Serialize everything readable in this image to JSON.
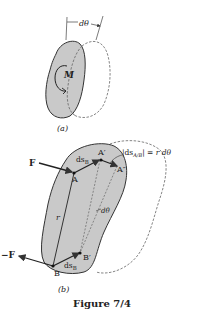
{
  "figure": {
    "caption": "Figure 7/4",
    "colors": {
      "body_fill": "#c9c9c9",
      "outline": "#333333",
      "dashed": "#666666",
      "background": "#ffffff"
    },
    "panel_a": {
      "label": "(a)",
      "angle_label": "dθ",
      "moment_label": "M"
    },
    "panel_b": {
      "label": "(b)",
      "force_label": "F",
      "neg_force_label": "−F",
      "point_A": "A",
      "point_A_prime": "A′",
      "point_A_double_prime": "A″",
      "point_B": "B",
      "point_B_prime": "B′",
      "ds_B_label_top": "ds",
      "ds_B_sub_top": "B",
      "ds_B_label_bottom": "ds",
      "ds_B_sub_bottom": "B",
      "radius_label": "r",
      "angle_label": "dθ",
      "relation_prefix": "|ds",
      "relation_sub": "A/B",
      "relation_suffix": "| = r dθ"
    }
  }
}
